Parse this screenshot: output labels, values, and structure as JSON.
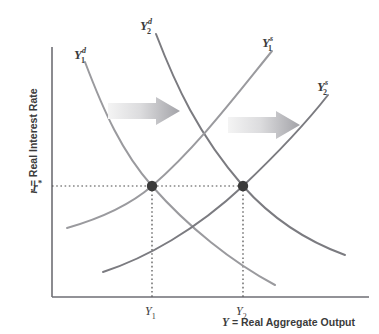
{
  "figure": {
    "type": "economics-diagram",
    "background_color": "#ffffff",
    "axes": {
      "y_title_var": "r",
      "y_title_rest": " = Real Interest Rate",
      "x_title_var": "Y",
      "x_title_rest": " = Real Aggregate Output",
      "axis_color": "#6e6e74",
      "origin": {
        "x": 52,
        "y": 297
      },
      "x_end": 369,
      "y_top": 47
    },
    "tick_labels": {
      "r_star_base": "r",
      "r_star_sup": "*",
      "y1_base": "Y",
      "y1_sub": "1",
      "y2_base": "Y",
      "y2_sub": "2"
    },
    "curve_labels": [
      {
        "name": "demand-1",
        "base": "Y",
        "sub": "1",
        "sup": "d",
        "x": 74,
        "y": 46,
        "color": "#9a9a9e"
      },
      {
        "name": "demand-2",
        "base": "Y",
        "sub": "2",
        "sup": "d",
        "x": 140,
        "y": 17,
        "color": "#7b7b80"
      },
      {
        "name": "supply-1",
        "base": "Y",
        "sub": "1",
        "sup": "s",
        "x": 262,
        "y": 34,
        "color": "#9a9a9e"
      },
      {
        "name": "supply-2",
        "base": "Y",
        "sub": "2",
        "sup": "s",
        "x": 317,
        "y": 78,
        "color": "#7b7b80"
      }
    ],
    "arrows": [
      {
        "name": "demand-shift-arrow",
        "x": 108,
        "y": 98,
        "width": 72,
        "height": 26,
        "gradient_from": "#f2f2f2",
        "gradient_to": "#a8a8ac"
      },
      {
        "name": "supply-shift-arrow",
        "x": 228,
        "y": 112,
        "width": 72,
        "height": 26,
        "gradient_from": "#f2f2f2",
        "gradient_to": "#a8a8ac"
      }
    ],
    "equilibrium_points": [
      {
        "name": "equilibrium-1",
        "x": 152,
        "y": 186,
        "r_label": "r*",
        "y_label": "Y1",
        "color": "#3b3b3b"
      },
      {
        "name": "equilibrium-2",
        "x": 243,
        "y": 186,
        "r_label": "r*",
        "y_label": "Y2",
        "color": "#3b3b3b"
      }
    ],
    "guide_lines": {
      "color": "#4a4a4a",
      "r_star_y": 186,
      "y1_x": 152,
      "y2_x": 243,
      "baseline_y": 297
    }
  },
  "chart_data": {
    "type": "line",
    "title": "",
    "xlabel": "Y = Real Aggregate Output",
    "ylabel": "r = Real Interest Rate",
    "grid": false,
    "legend": "none",
    "xlim": [
      52,
      369
    ],
    "ylim": [
      297,
      47
    ],
    "annotations": [
      "Rightward shift of loanable-funds demand from Y1d to Y2d",
      "Rightward shift of loanable-funds supply from Y1s to Y2s",
      "Real interest rate stays at r* while output rises from Y1 to Y2"
    ],
    "series": [
      {
        "name": "Y1d",
        "role": "demand",
        "color": "#9a9a9e",
        "width": 2.0,
        "path": "M 85,62 C 104,112 122,152 152,186 C 188,227 232,262 275,285"
      },
      {
        "name": "Y2d",
        "role": "demand",
        "color": "#7b7b80",
        "width": 2.0,
        "path": "M 156,34 C 176,86 198,134 243,186 C 275,222 312,243 345,255"
      },
      {
        "name": "Y1s",
        "role": "supply",
        "color": "#9a9a9e",
        "width": 2.0,
        "path": "M 67,228 C 102,218 130,205 152,186 C 196,148 234,98 272,51"
      },
      {
        "name": "Y2s",
        "role": "supply",
        "color": "#7b7b80",
        "width": 2.0,
        "path": "M 103,272 C 146,258 196,230 243,186 C 282,149 310,118 328,95"
      }
    ],
    "markers": [
      {
        "x": 152,
        "y": 186,
        "label": "E1",
        "color": "#3b3b3b",
        "size": 5.2
      },
      {
        "x": 243,
        "y": 186,
        "label": "E2",
        "color": "#3b3b3b",
        "size": 5.2
      }
    ]
  }
}
